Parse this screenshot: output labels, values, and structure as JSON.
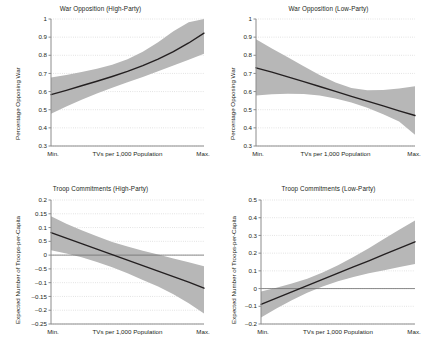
{
  "figure": {
    "background": "#ffffff",
    "band_color": "#b7b7b7",
    "line_color": "#231f20",
    "axis_color": "#8c8c8c",
    "grid_color": "#cfcfcf"
  },
  "chart_data": [
    {
      "type": "line",
      "panel": "top-left",
      "title": "War Opposition (High-Party)",
      "xlabel": "TVs per 1,000 Population",
      "ylabel": "Percentage Opposing War",
      "xticklabels": [
        "Min.",
        "Max."
      ],
      "yticklabels": [
        "1",
        "0.9",
        "0.8",
        "0.7",
        "0.6",
        "0.5",
        "0.4",
        "0.3"
      ],
      "ytickvalues": [
        1,
        0.9,
        0.8,
        0.7,
        0.6,
        0.5,
        0.4,
        0.3
      ],
      "ylim": [
        0.3,
        1.0
      ],
      "xlim": [
        0,
        1
      ],
      "grid": true,
      "zero_line": false,
      "x": [
        0,
        0.1,
        0.2,
        0.3,
        0.4,
        0.5,
        0.6,
        0.7,
        0.8,
        0.9,
        1
      ],
      "series": [
        {
          "name": "Predicted probability",
          "values": [
            0.583,
            0.607,
            0.632,
            0.657,
            0.683,
            0.711,
            0.743,
            0.779,
            0.82,
            0.868,
            0.922
          ]
        }
      ],
      "band": {
        "name": "95% confidence interval",
        "lower": [
          0.478,
          0.518,
          0.555,
          0.589,
          0.621,
          0.651,
          0.681,
          0.712,
          0.744,
          0.776,
          0.808
        ],
        "upper": [
          0.678,
          0.692,
          0.708,
          0.726,
          0.748,
          0.778,
          0.819,
          0.872,
          0.932,
          0.982,
          1.0
        ]
      }
    },
    {
      "type": "line",
      "panel": "top-right",
      "title": "War Opposition (Low-Party)",
      "xlabel": "TVs per 1,000 Population",
      "ylabel": "Percentage Opposing War",
      "xticklabels": [
        "Min.",
        "Max."
      ],
      "yticklabels": [
        "1",
        "0.9",
        "0.8",
        "0.7",
        "0.6",
        "0.5",
        "0.4",
        "0.3"
      ],
      "ytickvalues": [
        1,
        0.9,
        0.8,
        0.7,
        0.6,
        0.5,
        0.4,
        0.3
      ],
      "ylim": [
        0.3,
        1.0
      ],
      "xlim": [
        0,
        1
      ],
      "grid": true,
      "zero_line": false,
      "x": [
        0,
        0.1,
        0.2,
        0.3,
        0.4,
        0.5,
        0.6,
        0.7,
        0.8,
        0.9,
        1
      ],
      "series": [
        {
          "name": "Predicted probability",
          "values": [
            0.731,
            0.707,
            0.681,
            0.655,
            0.628,
            0.601,
            0.574,
            0.547,
            0.521,
            0.494,
            0.468
          ]
        }
      ],
      "band": {
        "name": "95% confidence interval",
        "lower": [
          0.579,
          0.585,
          0.588,
          0.586,
          0.578,
          0.562,
          0.54,
          0.511,
          0.475,
          0.435,
          0.362
        ],
        "upper": [
          0.889,
          0.838,
          0.789,
          0.739,
          0.692,
          0.65,
          0.62,
          0.607,
          0.609,
          0.617,
          0.629
        ]
      }
    },
    {
      "type": "line",
      "panel": "bottom-left",
      "title": "Troop Commitments (High-Party)",
      "xlabel": "TVs per 1,000 Population",
      "ylabel": "Expected Number of Troops-per-Capita",
      "xticklabels": [
        "Min.",
        "Max."
      ],
      "yticklabels": [
        "0.2",
        "0.15",
        "0.1",
        "0.5",
        "0",
        "–0.5",
        "–0.1",
        "–0.15",
        "–0.2",
        "–0.25"
      ],
      "ytickvalues": [
        0.2,
        0.15,
        0.1,
        0.05,
        0,
        -0.05,
        -0.1,
        -0.15,
        -0.2,
        -0.25
      ],
      "ylim": [
        -0.25,
        0.2
      ],
      "xlim": [
        0,
        1
      ],
      "grid": true,
      "zero_line": true,
      "x": [
        0,
        0.1,
        0.2,
        0.3,
        0.4,
        0.5,
        0.6,
        0.7,
        0.8,
        0.9,
        1
      ],
      "series": [
        {
          "name": "Expected value",
          "values": [
            0.082,
            0.062,
            0.042,
            0.022,
            0.002,
            -0.018,
            -0.038,
            -0.058,
            -0.078,
            -0.098,
            -0.12
          ]
        }
      ],
      "band": {
        "name": "95% confidence interval",
        "lower": [
          0.018,
          0.006,
          -0.008,
          -0.025,
          -0.044,
          -0.066,
          -0.09,
          -0.114,
          -0.142,
          -0.175,
          -0.212
        ],
        "upper": [
          0.141,
          0.114,
          0.09,
          0.068,
          0.048,
          0.031,
          0.016,
          0.002,
          -0.012,
          -0.026,
          -0.04
        ]
      }
    },
    {
      "type": "line",
      "panel": "bottom-right",
      "title": "Troop Commitments (Low-Party)",
      "xlabel": "TVs per 1,000 Population",
      "ylabel": "Expected Number of Troops-per-Capita",
      "xticklabels": [
        "Min.",
        "Max."
      ],
      "yticklabels": [
        "0.5",
        "0.4",
        "0.3",
        "0.2",
        "0.1",
        "0",
        "–0.1",
        "–0.2"
      ],
      "ytickvalues": [
        0.5,
        0.4,
        0.3,
        0.2,
        0.1,
        0,
        -0.1,
        -0.2
      ],
      "ylim": [
        -0.2,
        0.5
      ],
      "xlim": [
        0,
        1
      ],
      "grid": true,
      "zero_line": true,
      "x": [
        0,
        0.1,
        0.2,
        0.3,
        0.4,
        0.5,
        0.6,
        0.7,
        0.8,
        0.9,
        1
      ],
      "series": [
        {
          "name": "Expected value",
          "values": [
            -0.089,
            -0.054,
            -0.019,
            0.016,
            0.052,
            0.087,
            0.122,
            0.157,
            0.193,
            0.228,
            0.264
          ]
        }
      ],
      "band": {
        "name": "95% confidence interval",
        "lower": [
          -0.163,
          -0.113,
          -0.066,
          -0.024,
          0.012,
          0.042,
          0.066,
          0.086,
          0.104,
          0.122,
          0.139
        ],
        "upper": [
          -0.016,
          0.005,
          0.028,
          0.056,
          0.091,
          0.132,
          0.178,
          0.228,
          0.281,
          0.333,
          0.384
        ]
      }
    }
  ]
}
